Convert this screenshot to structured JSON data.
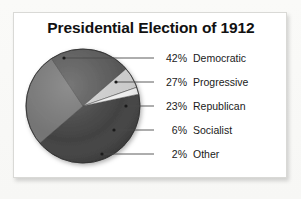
{
  "card": {
    "background_color": "#ffffff",
    "border_color": "#d9d9d6"
  },
  "title": "Presidential Election of 1912",
  "legend": {
    "rows": [
      {
        "percent": "42%",
        "name": "Democratic"
      },
      {
        "percent": "27%",
        "name": "Progressive"
      },
      {
        "percent": "23%",
        "name": "Republican"
      },
      {
        "percent": "6%",
        "name": "Socialist"
      },
      {
        "percent": "2%",
        "name": "Other"
      }
    ]
  },
  "chart_data": {
    "type": "pie",
    "title": "Presidential Election of 1912",
    "xlabel": "",
    "ylabel": "",
    "labels": [
      "Democratic",
      "Progressive",
      "Republican",
      "Socialist",
      "Other"
    ],
    "values": [
      42,
      27,
      23,
      6,
      2
    ],
    "value_suffix": "%",
    "colors": [
      "#3a3a3a",
      "#6e6e6e",
      "#505050",
      "#c9c9c9",
      "#ededed"
    ],
    "legend_position": "right",
    "grid": false,
    "start_angle_deg": -12,
    "direction": "clockwise",
    "leader_lines": true,
    "slices": [
      {
        "label": "Democratic",
        "value": 42,
        "percent": "42%",
        "color": "#3a3a3a"
      },
      {
        "label": "Progressive",
        "value": 27,
        "percent": "27%",
        "color": "#6e6e6e"
      },
      {
        "label": "Republican",
        "value": 23,
        "percent": "23%",
        "color": "#505050"
      },
      {
        "label": "Socialist",
        "value": 6,
        "percent": "6%",
        "color": "#c9c9c9"
      },
      {
        "label": "Other",
        "value": 2,
        "percent": "2%",
        "color": "#ededed"
      }
    ]
  }
}
